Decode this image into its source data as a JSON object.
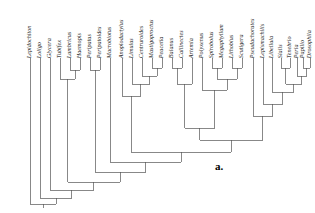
{
  "figure": {
    "type": "cladogram",
    "panel_label": "a.",
    "orientation": "tips-at-top",
    "line_color": "#555555",
    "text_color": "#1a1a1a",
    "background": "#ffffff"
  },
  "taxa": [
    {
      "index": 0,
      "name": "Lepidochiton",
      "x": 30
    },
    {
      "index": 1,
      "name": "Loligo",
      "x": 40
    },
    {
      "index": 2,
      "name": "Glycera",
      "x": 50
    },
    {
      "index": 3,
      "name": "Tubifex",
      "x": 60
    },
    {
      "index": 4,
      "name": "Lumbricus",
      "x": 70
    },
    {
      "index": 5,
      "name": "Haemopis",
      "x": 80
    },
    {
      "index": 6,
      "name": "Peripatus",
      "x": 90
    },
    {
      "index": 7,
      "name": "Peripatoides",
      "x": 100
    },
    {
      "index": 8,
      "name": "Macrobiotus",
      "x": 110
    },
    {
      "index": 9,
      "name": "Anoplodactylus",
      "x": 122
    },
    {
      "index": 10,
      "name": "Limulus",
      "x": 132
    },
    {
      "index": 11,
      "name": "Centruroides",
      "x": 142
    },
    {
      "index": 12,
      "name": "Mastigoproctus",
      "x": 152
    },
    {
      "index": 13,
      "name": "Peucetia",
      "x": 162
    },
    {
      "index": 14,
      "name": "Balanus",
      "x": 172
    },
    {
      "index": 15,
      "name": "Callinectes",
      "x": 182
    },
    {
      "index": 16,
      "name": "Artemia",
      "x": 192
    },
    {
      "index": 17,
      "name": "Polyxenus",
      "x": 202
    },
    {
      "index": 18,
      "name": "Spirobolus",
      "x": 212
    },
    {
      "index": 19,
      "name": "Megaphyllum",
      "x": 222
    },
    {
      "index": 20,
      "name": "Lithobius",
      "x": 232
    },
    {
      "index": 21,
      "name": "Scutigera",
      "x": 242
    },
    {
      "index": 22,
      "name": "Pseudachorutes",
      "x": 253
    },
    {
      "index": 23,
      "name": "Lepismachilis",
      "x": 263
    },
    {
      "index": 24,
      "name": "Libellula",
      "x": 272
    },
    {
      "index": 25,
      "name": "Sialis",
      "x": 281
    },
    {
      "index": 26,
      "name": "Tenebrio",
      "x": 290
    },
    {
      "index": 27,
      "name": "Perla",
      "x": 297
    },
    {
      "index": 28,
      "name": "Papilio",
      "x": 303
    },
    {
      "index": 29,
      "name": "Drosophila",
      "x": 310
    }
  ],
  "nodes": [
    {
      "id": "n_lum_hae",
      "children_x": [
        70,
        80
      ],
      "y": 70,
      "label": "Lumbricus+Haemopis"
    },
    {
      "id": "n_annelid",
      "children_x": [
        60,
        75
      ],
      "y": 79,
      "label": "Tubifex+(Lumbricus,Haemopis)"
    },
    {
      "id": "n_onych",
      "children_x": [
        90,
        100
      ],
      "y": 70,
      "label": "Peripatus+Peripatoides"
    },
    {
      "id": "n_mast_peu",
      "children_x": [
        152,
        162
      ],
      "y": 68,
      "label": "Mastigoproctus+Peucetia"
    },
    {
      "id": "n_arachn",
      "children_x": [
        142,
        157
      ],
      "y": 76,
      "label": "Centruroides+(Mastigoproctus,Peucetia)"
    },
    {
      "id": "n_euchel",
      "children_x": [
        132,
        149.5
      ],
      "y": 84,
      "label": "Limulus+Arachnida"
    },
    {
      "id": "n_chelic",
      "children_x": [
        122,
        140.7
      ],
      "y": 96,
      "label": "Anoplodactylus+Euchelicerata"
    },
    {
      "id": "n_bal_cal",
      "children_x": [
        172,
        182
      ],
      "y": 68,
      "label": "Balanus+Callinectes"
    },
    {
      "id": "n_crust",
      "children_x": [
        177,
        192
      ],
      "y": 84,
      "label": "(Balanus,Callinectes)+Artemia"
    },
    {
      "id": "n_dipl",
      "children_x": [
        212,
        222
      ],
      "y": 68,
      "label": "Spirobolus+Megaphyllum"
    },
    {
      "id": "n_chil",
      "children_x": [
        232,
        242
      ],
      "y": 68,
      "label": "Lithobius+Scutigera"
    },
    {
      "id": "n_myria_in",
      "children_x": [
        217,
        237
      ],
      "y": 79,
      "label": "Diplopoda+Chilopoda"
    },
    {
      "id": "n_myria",
      "children_x": [
        202,
        227
      ],
      "y": 90,
      "label": "Polyxenus+(Diplopoda,Chilopoda)"
    },
    {
      "id": "n_sia_ten",
      "children_x": [
        281,
        290
      ],
      "y": 68,
      "label": "Sialis+Tenebrio"
    },
    {
      "id": "n_pap_dro",
      "children_x": [
        303,
        310
      ],
      "y": 68,
      "label": "Papilio+Drosophila"
    },
    {
      "id": "n_perla",
      "children_x": [
        297,
        306.5
      ],
      "y": 76,
      "label": "Perla+(Papilio,Drosophila)"
    },
    {
      "id": "n_neopt",
      "children_x": [
        285.5,
        301.7
      ],
      "y": 84,
      "label": "(Sialis,Tenebrio)+Perla-clade"
    },
    {
      "id": "n_ptery",
      "children_x": [
        272,
        293.6
      ],
      "y": 92,
      "label": "Libellula+Neoptera"
    },
    {
      "id": "n_insect1",
      "children_x": [
        263,
        282.8
      ],
      "y": 104,
      "label": "Lepismachilis+Pterygota"
    },
    {
      "id": "n_hexapod",
      "children_x": [
        253,
        272.9
      ],
      "y": 116,
      "label": "Pseudachorutes+Insecta"
    },
    {
      "id": "n_mandib",
      "children_x": [
        184.5,
        214.5
      ],
      "y": 128,
      "label": "Crustacea+Myriapoda"
    },
    {
      "id": "n_mand_hex",
      "children_x": [
        199.5,
        262.9
      ],
      "y": 140,
      "label": "Mandibulata+Hexapoda"
    },
    {
      "id": "n_arthro",
      "children_x": [
        131.3,
        231.2
      ],
      "y": 152,
      "label": "Chelicerata+Mandibulata-Hexapoda"
    },
    {
      "id": "n_tardi",
      "children_x": [
        110,
        181.2
      ],
      "y": 162,
      "label": "Macrobiotus+Arthropoda"
    },
    {
      "id": "n_panarth",
      "children_x": [
        95,
        145.6
      ],
      "y": 172,
      "label": "Onychophora+(Tardigrada,Arthropoda)"
    },
    {
      "id": "n_articul",
      "children_x": [
        67.5,
        120.3
      ],
      "y": 182,
      "label": "Annelida+Panarthropoda"
    },
    {
      "id": "n_lophotr",
      "children_x": [
        50,
        93.9
      ],
      "y": 190,
      "label": "Glycera+Articulata"
    },
    {
      "id": "n_root2",
      "children_x": [
        40,
        72
      ],
      "y": 198,
      "label": "Loligo+rest"
    },
    {
      "id": "n_root",
      "children_x": [
        30,
        56
      ],
      "y": 204,
      "label": "root"
    }
  ],
  "axis": {
    "tip_y": 58,
    "root_y": 204
  }
}
